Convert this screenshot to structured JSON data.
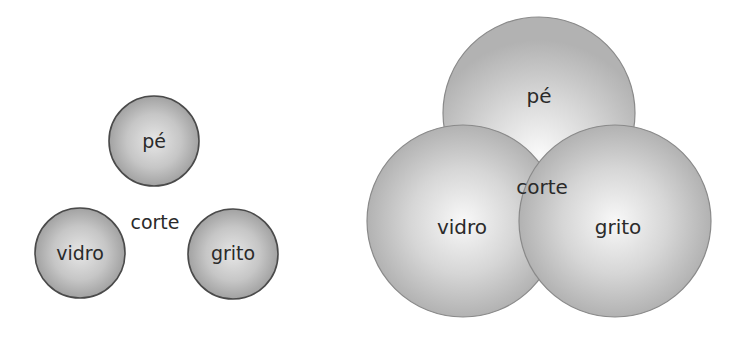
{
  "diagram": {
    "left": {
      "title": "separate circles",
      "circles": [
        {
          "label": "pé",
          "cx": 154,
          "cy": 141,
          "r": 45
        },
        {
          "label": "vidro",
          "cx": 80,
          "cy": 253,
          "r": 45
        },
        {
          "label": "grito",
          "cx": 233,
          "cy": 254,
          "r": 45
        }
      ],
      "center_label": {
        "text": "corte",
        "x": 155,
        "y": 229
      }
    },
    "right": {
      "title": "overlapping circles",
      "circles": [
        {
          "label": "pé",
          "cx": 539,
          "cy": 113,
          "r": 96
        },
        {
          "label": "vidro",
          "cx": 463,
          "cy": 221,
          "r": 96
        },
        {
          "label": "grito",
          "cx": 615,
          "cy": 221,
          "r": 96
        }
      ],
      "center_label": {
        "text": "corte",
        "x": 542,
        "y": 194
      }
    }
  },
  "colors": {
    "small_center": "#e2e2e2",
    "small_edge": "#a4a4a4",
    "small_stroke": "#4a4a4a",
    "big_center": "#f7f7f7",
    "big_edge": "#b4b4b4",
    "big_stroke": "#8a8a8a",
    "text": "#2a2a2a"
  }
}
